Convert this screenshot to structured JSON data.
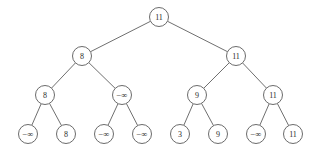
{
  "figure": {
    "background_color": "#ffffff",
    "edge_color": "#4a4a4a",
    "node_stroke_color": "#5a5a5a",
    "node_fill_color": "#ffffff",
    "label_color": "#2b2b2b"
  },
  "chart_data": {
    "type": "diagram",
    "subtype": "binary-tree",
    "levels": 4,
    "node_count": 15,
    "radius": 9.5,
    "nodes": [
      {
        "id": "n0",
        "label": "11",
        "level": 0,
        "x": 159,
        "y": 17,
        "parent": null
      },
      {
        "id": "n1",
        "label": "8",
        "level": 1,
        "x": 82,
        "y": 56,
        "parent": "n0"
      },
      {
        "id": "n2",
        "label": "11",
        "level": 1,
        "x": 236,
        "y": 56,
        "parent": "n0"
      },
      {
        "id": "n3",
        "label": "8",
        "level": 2,
        "x": 45,
        "y": 95,
        "parent": "n1"
      },
      {
        "id": "n4",
        "label": "−∞",
        "level": 2,
        "x": 122,
        "y": 95,
        "parent": "n1"
      },
      {
        "id": "n5",
        "label": "9",
        "level": 2,
        "x": 197,
        "y": 95,
        "parent": "n2"
      },
      {
        "id": "n6",
        "label": "11",
        "level": 2,
        "x": 273,
        "y": 95,
        "parent": "n2"
      },
      {
        "id": "n7",
        "label": "−∞",
        "level": 3,
        "x": 28,
        "y": 134,
        "parent": "n3"
      },
      {
        "id": "n8",
        "label": "8",
        "level": 3,
        "x": 66,
        "y": 134,
        "parent": "n3"
      },
      {
        "id": "n9",
        "label": "−∞",
        "level": 3,
        "x": 104,
        "y": 134,
        "parent": "n4"
      },
      {
        "id": "n10",
        "label": "−∞",
        "level": 3,
        "x": 142,
        "y": 134,
        "parent": "n4"
      },
      {
        "id": "n11",
        "label": "3",
        "level": 3,
        "x": 180,
        "y": 134,
        "parent": "n5"
      },
      {
        "id": "n12",
        "label": "9",
        "level": 3,
        "x": 218,
        "y": 134,
        "parent": "n5"
      },
      {
        "id": "n13",
        "label": "−∞",
        "level": 3,
        "x": 256,
        "y": 134,
        "parent": "n6"
      },
      {
        "id": "n14",
        "label": "11",
        "level": 3,
        "x": 293,
        "y": 134,
        "parent": "n6"
      }
    ],
    "edges": [
      {
        "from": "n0",
        "to": "n1"
      },
      {
        "from": "n0",
        "to": "n2"
      },
      {
        "from": "n1",
        "to": "n3"
      },
      {
        "from": "n1",
        "to": "n4"
      },
      {
        "from": "n2",
        "to": "n5"
      },
      {
        "from": "n2",
        "to": "n6"
      },
      {
        "from": "n3",
        "to": "n7"
      },
      {
        "from": "n3",
        "to": "n8"
      },
      {
        "from": "n4",
        "to": "n9"
      },
      {
        "from": "n4",
        "to": "n10"
      },
      {
        "from": "n5",
        "to": "n11"
      },
      {
        "from": "n5",
        "to": "n12"
      },
      {
        "from": "n6",
        "to": "n13"
      },
      {
        "from": "n6",
        "to": "n14"
      }
    ]
  }
}
